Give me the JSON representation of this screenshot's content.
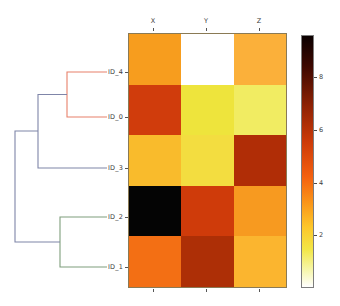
{
  "figure": {
    "type": "clustermap",
    "background": "#ffffff"
  },
  "chart_data": {
    "type": "heatmap",
    "title": "",
    "xlabel": "",
    "ylabel": "",
    "columns": [
      "X",
      "Y",
      "Z"
    ],
    "rows": [
      "ID_4",
      "ID_0",
      "ID_3",
      "ID_2",
      "ID_1"
    ],
    "values": [
      [
        5.2,
        0.1,
        4.9
      ],
      [
        6.9,
        3.3,
        2.9
      ],
      [
        4.6,
        3.9,
        7.5
      ],
      [
        9.4,
        7.0,
        5.3
      ],
      [
        5.9,
        7.4,
        4.6
      ]
    ],
    "cell_colors": [
      [
        "#f79d1e",
        "#ffffff",
        "#fbb03a"
      ],
      [
        "#d03c0c",
        "#eee43c",
        "#f1ec62"
      ],
      [
        "#f9bb2c",
        "#f3dd40",
        "#b02d06"
      ],
      [
        "#040404",
        "#cf3b0a",
        "#f79a20"
      ],
      [
        "#f36f14",
        "#ad2f06",
        "#fbb52f"
      ]
    ],
    "colormap": "hot",
    "colorbar": {
      "ticks": [
        2,
        4,
        6,
        8
      ],
      "tick_labels": [
        "2",
        "4",
        "6",
        "8"
      ],
      "vmin": 0.0,
      "vmax": 9.6,
      "orientation": "vertical",
      "position": "right",
      "gradient_stops": [
        {
          "pos": 0,
          "color": "#0a0000"
        },
        {
          "pos": 12,
          "color": "#3d0800"
        },
        {
          "pos": 28,
          "color": "#8f2204"
        },
        {
          "pos": 42,
          "color": "#cc3a08"
        },
        {
          "pos": 56,
          "color": "#f4600f"
        },
        {
          "pos": 66,
          "color": "#fa9318"
        },
        {
          "pos": 76,
          "color": "#fdc629"
        },
        {
          "pos": 85,
          "color": "#f2e646"
        },
        {
          "pos": 93,
          "color": "#f6f6a8"
        },
        {
          "pos": 100,
          "color": "#ffffff"
        }
      ]
    },
    "grid": false,
    "legend": "colorbar-right"
  },
  "dendrogram": {
    "orientation": "left",
    "colors": {
      "link_default": "#7f85a8",
      "cluster_red": "#e8806a",
      "cluster_green": "#7f9e7c"
    },
    "leaves": [
      {
        "label": "ID_4",
        "y": 72
      },
      {
        "label": "ID_0",
        "y": 117
      },
      {
        "label": "ID_3",
        "y": 168
      },
      {
        "label": "ID_2",
        "y": 217
      },
      {
        "label": "ID_1",
        "y": 267
      }
    ],
    "links": [
      {
        "name": "merge-ID4-ID0",
        "color": "cluster_red"
      },
      {
        "name": "merge-redcluster-ID3",
        "color": "link_default"
      },
      {
        "name": "merge-ID2-ID1",
        "color": "cluster_green"
      },
      {
        "name": "merge-root",
        "color": "link_default"
      }
    ]
  },
  "axes": {
    "column_labels": [
      "X",
      "Y",
      "Z"
    ],
    "row_labels": [
      "ID_4",
      "ID_0",
      "ID_3",
      "ID_2",
      "ID_1"
    ]
  }
}
